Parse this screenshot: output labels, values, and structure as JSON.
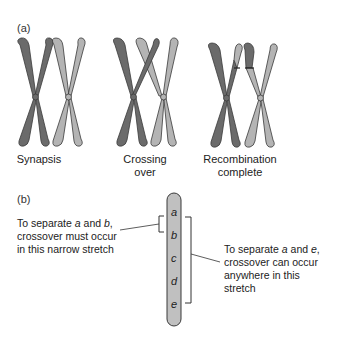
{
  "panel_a": {
    "label": "(a)",
    "stages": [
      {
        "caption_line1": "Synapsis",
        "caption_line2": ""
      },
      {
        "caption_line1": "Crossing",
        "caption_line2": "over"
      },
      {
        "caption_line1": "Recombination",
        "caption_line2": "complete"
      }
    ],
    "colors": {
      "dark": "#6b6b6b",
      "light": "#b4b4b4",
      "outline": "#3a3a3a"
    }
  },
  "panel_b": {
    "label": "(b)",
    "genes": [
      "a",
      "b",
      "c",
      "d",
      "e"
    ],
    "left_note": {
      "line1_pre": "To separate ",
      "gene1": "a",
      "mid": " and ",
      "gene2": "b",
      "line1_post": ",",
      "line2": "crossover must occur",
      "line3": "in this narrow stretch"
    },
    "right_note": {
      "line1_pre": "To separate ",
      "gene1": "a",
      "mid": " and ",
      "gene2": "e",
      "line1_post": ",",
      "line2": "crossover can occur",
      "line3": "anywhere in this",
      "line4": "stretch"
    },
    "colors": {
      "chromosome": "#c0c0c0",
      "outline": "#3a3a3a"
    }
  }
}
